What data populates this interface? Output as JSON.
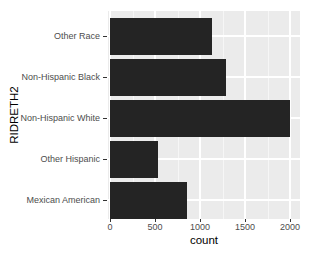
{
  "colors": {
    "page_bg": "#FFFFFF",
    "panel_bg": "#EBEBEB",
    "bar_fill": "#242424",
    "grid_major": "#FFFFFF",
    "grid_minor": "rgba(255,255,255,0.55)",
    "axis_text": "#4D4D4D",
    "axis_title": "#000000",
    "tick_mark": "#333333"
  },
  "chart_data": {
    "type": "bar",
    "orientation": "horizontal",
    "theme": "ggplot2-grey",
    "title": "",
    "xlabel": "count",
    "ylabel": "RIDRETH2",
    "categories_top_to_bottom": [
      "Other Race",
      "Non-Hispanic Black",
      "Non-Hispanic White",
      "Other Hispanic",
      "Mexican American"
    ],
    "values": [
      1135,
      1290,
      2005,
      535,
      855
    ],
    "x_ticks": [
      0,
      500,
      1000,
      1500,
      2000
    ],
    "x_tick_labels": [
      "0",
      "500",
      "1000",
      "1500",
      "2000"
    ],
    "x_minor_ticks": [
      250,
      750,
      1250,
      1750
    ],
    "xlim": [
      0,
      2100
    ],
    "grid": true,
    "legend": false
  }
}
